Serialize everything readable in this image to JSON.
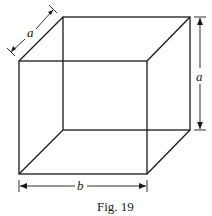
{
  "figure": {
    "caption": "Fig. 19",
    "labels": {
      "depth": "a",
      "height": "a",
      "width": "b"
    },
    "colors": {
      "line": "#1a1a1a",
      "background": "#ffffff"
    }
  }
}
